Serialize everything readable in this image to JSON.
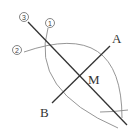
{
  "diagram": {
    "colors": {
      "line": "#333333",
      "arc": "#8a8a8a",
      "label": "#333333",
      "circle_marker": "#666666"
    },
    "points": {
      "A": {
        "label": "A",
        "x": 110,
        "y": 46
      },
      "B": {
        "label": "B",
        "x": 52,
        "y": 103
      },
      "M": {
        "label": "M",
        "x": 81,
        "y": 76
      },
      "P_top": {
        "x": 46,
        "y": 42
      },
      "P_bottom": {
        "x": 115,
        "y": 113
      }
    },
    "step_markers": [
      {
        "id": "step1",
        "label": "1",
        "x": 50,
        "y": 23
      },
      {
        "id": "step2",
        "label": "2",
        "x": 18,
        "y": 50
      },
      {
        "id": "step3",
        "label": "3",
        "x": 25,
        "y": 17
      }
    ],
    "labels": {
      "A": "A",
      "B": "B",
      "M": "M",
      "step1": "1",
      "step2": "2",
      "step3": "3"
    }
  }
}
